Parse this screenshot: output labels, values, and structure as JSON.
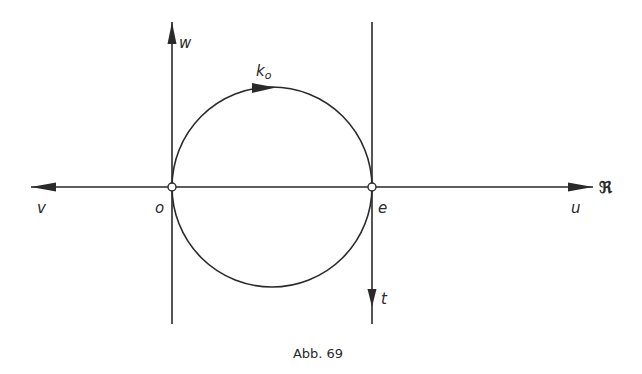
{
  "figure": {
    "caption": "Abb. 69",
    "labels": {
      "w": "w",
      "k0_main": "k",
      "k0_sub": "o",
      "v": "v",
      "o": "o",
      "e": "e",
      "u": "u",
      "real_axis": "ℜ",
      "t": "t"
    },
    "colors": {
      "stroke": "#2a2a2a",
      "background": "#ffffff"
    }
  }
}
